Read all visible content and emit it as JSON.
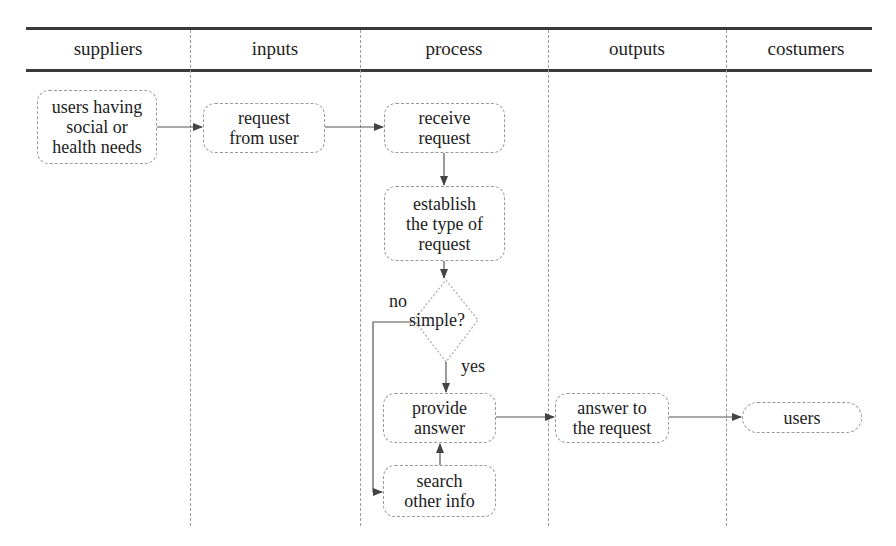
{
  "lanes": [
    {
      "label": "suppliers"
    },
    {
      "label": "inputs"
    },
    {
      "label": "process"
    },
    {
      "label": "outputs"
    },
    {
      "label": "costumers"
    }
  ],
  "nodes": {
    "users_needs": "users having\nsocial or\nhealth needs",
    "request_from_user": "request\nfrom user",
    "receive_request": "receive\nrequest",
    "establish_type": "establish\nthe type of\nrequest",
    "decision": "simple?",
    "provide_answer": "provide\nanswer",
    "search_info": "search\nother info",
    "answer_request": "answer to\nthe request",
    "users": "users"
  },
  "edge_labels": {
    "no": "no",
    "yes": "yes"
  },
  "colors": {
    "rule": "#3a3a3a",
    "divider": "#9a9a9a",
    "arrow": "#444444",
    "box_border": "#999999"
  }
}
